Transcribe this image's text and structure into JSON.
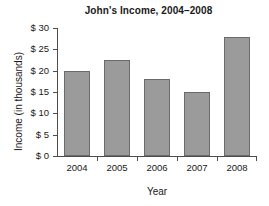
{
  "chart_data": {
    "type": "bar",
    "title": "John's Income, 2004–2008",
    "xlabel": "Year",
    "ylabel": "Income (in thousands)",
    "categories": [
      "2004",
      "2005",
      "2006",
      "2007",
      "2008"
    ],
    "values": [
      20,
      22.5,
      18,
      15,
      28
    ],
    "ylim": [
      0,
      30
    ],
    "ytick_values": [
      0,
      5,
      10,
      15,
      20,
      25,
      30
    ],
    "ytick_labels": [
      "$ 0",
      "$ 5",
      "$ 10",
      "$ 15",
      "$ 20",
      "$ 25",
      "$ 30"
    ],
    "grid": false,
    "legend": false,
    "bar_color": "#9b9b9b",
    "bar_border_color": "#6b6b6b",
    "axis_color": "#4d4d4d",
    "background_color": "#ffffff"
  }
}
